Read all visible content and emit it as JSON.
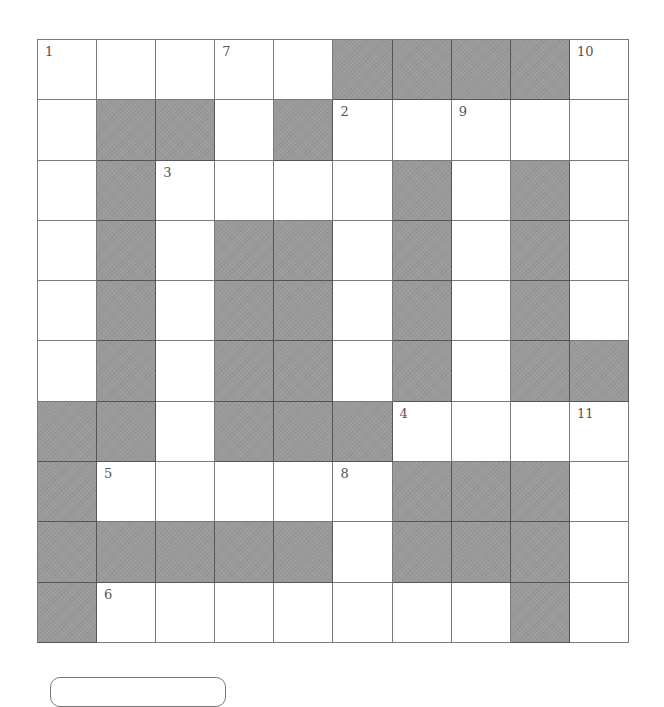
{
  "puzzle": {
    "type": "crossword",
    "rows": 10,
    "cols": 10,
    "shade_color": "#9a9a9a",
    "layout": [
      "WWWWWSSSSW",
      "WSSWSWWWWW",
      "WSWWWWSWSW",
      "WSWSSWSWSW",
      "WSWSSWSWSW",
      "WSWSSWSWSS",
      "SSWSSSWWWW",
      "SWWWWWSSSW",
      "SSSSSWSSSW",
      "SWWWWWWWSW"
    ],
    "clue_numbers": [
      {
        "row": 0,
        "col": 0,
        "label": "1"
      },
      {
        "row": 0,
        "col": 3,
        "label": "7"
      },
      {
        "row": 0,
        "col": 9,
        "label": "10"
      },
      {
        "row": 1,
        "col": 5,
        "label": "2"
      },
      {
        "row": 1,
        "col": 7,
        "label": "9"
      },
      {
        "row": 2,
        "col": 2,
        "label": "3"
      },
      {
        "row": 6,
        "col": 6,
        "label": "4"
      },
      {
        "row": 6,
        "col": 9,
        "label": "11"
      },
      {
        "row": 7,
        "col": 1,
        "label": "5"
      },
      {
        "row": 7,
        "col": 5,
        "label": "8"
      },
      {
        "row": 9,
        "col": 1,
        "label": "6"
      }
    ]
  }
}
